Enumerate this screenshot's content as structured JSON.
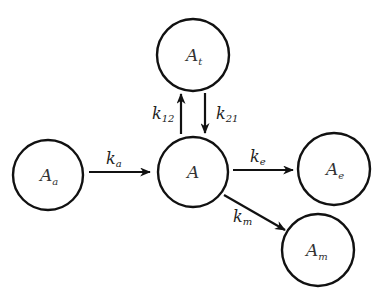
{
  "diagram": {
    "type": "compartment-model",
    "nodes": [
      {
        "id": "Aa",
        "base": "A",
        "sub": "a",
        "cx": 48,
        "cy": 175,
        "r": 35
      },
      {
        "id": "A",
        "base": "A",
        "sub": "",
        "cx": 193,
        "cy": 172,
        "r": 35
      },
      {
        "id": "At",
        "base": "A",
        "sub": "t",
        "cx": 193,
        "cy": 55,
        "r": 36
      },
      {
        "id": "Ae",
        "base": "A",
        "sub": "e",
        "cx": 334,
        "cy": 169,
        "r": 36
      },
      {
        "id": "Am",
        "base": "A",
        "sub": "m",
        "cx": 318,
        "cy": 250,
        "r": 36
      }
    ],
    "edges": [
      {
        "id": "ka",
        "from": "Aa",
        "to": "A",
        "label_base": "k",
        "label_sub": "a"
      },
      {
        "id": "k12",
        "from": "A",
        "to": "At",
        "label_base": "k",
        "label_sub": "12"
      },
      {
        "id": "k21",
        "from": "At",
        "to": "A",
        "label_base": "k",
        "label_sub": "21"
      },
      {
        "id": "ke",
        "from": "A",
        "to": "Ae",
        "label_base": "k",
        "label_sub": "e"
      },
      {
        "id": "km",
        "from": "A",
        "to": "Am",
        "label_base": "k",
        "label_sub": "m"
      }
    ]
  }
}
